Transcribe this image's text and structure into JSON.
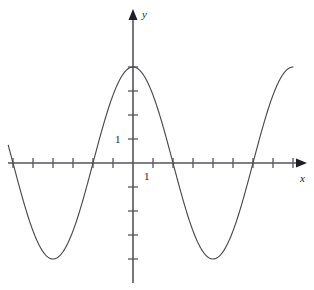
{
  "figure": {
    "background_color": "#ffffff",
    "axis_color": "#55555a",
    "curve_color": "#4a4a4f",
    "text_color": "#1a1a1a"
  },
  "labels": {
    "x_axis": "x",
    "y_axis": "y",
    "x_unit": "1",
    "y_unit": "1"
  },
  "chart_data": {
    "type": "line",
    "title": "",
    "subtitle": "",
    "xlabel": "x",
    "ylabel": "y",
    "legend": [],
    "grid": false,
    "annotations": [],
    "function": "y = 4 cos(2*pi*x/8)",
    "amplitude": 4,
    "period": 8,
    "xlim": [
      -6.3,
      8.0
    ],
    "ylim": [
      -5.0,
      5.2
    ],
    "x_unit_pixels": 20,
    "y_unit_pixels": 24,
    "x_tick_values": [
      -6,
      -5,
      -4,
      -3,
      -2,
      -1,
      1,
      2,
      3,
      4,
      5,
      6,
      7,
      8
    ],
    "x_labeled_ticks": [
      {
        "value": 1,
        "label": "1"
      }
    ],
    "y_tick_values": [
      -5,
      -4,
      -3,
      -2,
      -1,
      1,
      2,
      3,
      4
    ],
    "y_labeled_ticks": [
      {
        "value": 1,
        "label": "1"
      }
    ],
    "extrema": [
      {
        "kind": "maximum",
        "x": -4,
        "y": 4
      },
      {
        "kind": "minimum",
        "x": -2,
        "y": -4
      },
      {
        "kind": "maximum",
        "x": 0,
        "y": 4
      },
      {
        "kind": "minimum",
        "x": 2,
        "y": -4
      },
      {
        "kind": "maximum",
        "x": 4,
        "y": 4
      },
      {
        "kind": "minimum",
        "x": 6,
        "y": -4
      }
    ],
    "zeros": [
      -5,
      -3,
      -1,
      1,
      3,
      5,
      7
    ],
    "x": [
      -6.3,
      -6.1,
      -5.9,
      -5.7,
      -5.5,
      -5.3,
      -5.1,
      -4.9,
      -4.7,
      -4.5,
      -4.3,
      -4.1,
      -3.9,
      -3.7,
      -3.5,
      -3.3,
      -3.1,
      -2.9,
      -2.7,
      -2.5,
      -2.3,
      -2.1,
      -1.9,
      -1.7,
      -1.5,
      -1.3,
      -1.1,
      -0.9,
      -0.7,
      -0.5,
      -0.3,
      -0.1,
      0.1,
      0.3,
      0.5,
      0.7,
      0.9,
      1.1,
      1.3,
      1.5,
      1.7,
      1.9,
      2.1,
      2.3,
      2.5,
      2.7,
      2.9,
      3.1,
      3.3,
      3.5,
      3.7,
      3.9,
      4.1,
      4.3,
      4.5,
      4.7,
      4.9,
      5.1,
      5.3,
      5.5,
      5.7,
      5.9,
      6.1,
      6.3,
      6.5,
      6.7,
      6.9,
      7.1,
      7.3,
      7.5,
      7.7,
      7.9
    ],
    "y": [
      -2.37,
      -2.85,
      -3.27,
      -3.61,
      -3.86,
      -3.98,
      -4.0,
      -3.9,
      -3.69,
      -3.38,
      -2.98,
      -2.51,
      -1.97,
      -1.38,
      -0.77,
      -0.15,
      0.47,
      1.08,
      1.65,
      2.17,
      2.65,
      3.06,
      3.41,
      3.67,
      3.85,
      3.95,
      3.97,
      3.9,
      3.74,
      3.51,
      3.2,
      2.83,
      2.83,
      3.2,
      3.51,
      3.74,
      3.9,
      3.97,
      3.95,
      3.85,
      3.67,
      3.41,
      3.06,
      2.65,
      2.17,
      1.65,
      1.08,
      0.47,
      -0.15,
      -0.77,
      -1.38,
      -1.97,
      -2.51,
      -2.98,
      -3.38,
      -3.69,
      -3.9,
      -4.0,
      -3.98,
      -3.86,
      -3.61,
      -3.27,
      -2.85,
      -2.37,
      -1.84,
      -1.27,
      -0.67,
      -0.06,
      0.56,
      1.17,
      1.76,
      2.3
    ]
  }
}
